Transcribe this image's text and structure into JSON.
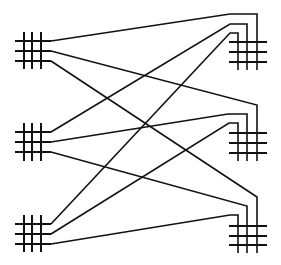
{
  "diagram": {
    "type": "bipartite-network",
    "width": 281,
    "height": 265,
    "stroke_color": "#111111",
    "background": "#ffffff",
    "left_nodes": [
      {
        "id": "L1",
        "rows": [
          41,
          51,
          61
        ],
        "cols": [
          24,
          32,
          41
        ],
        "x_min": 15,
        "x_max": 51,
        "y_min": 32,
        "y_max": 69
      },
      {
        "id": "L2",
        "rows": [
          132,
          142,
          152
        ],
        "cols": [
          24,
          32,
          41
        ],
        "x_min": 15,
        "x_max": 51,
        "y_min": 123,
        "y_max": 161
      },
      {
        "id": "L3",
        "rows": [
          224,
          234,
          244
        ],
        "cols": [
          24,
          32,
          41
        ],
        "x_min": 15,
        "x_max": 51,
        "y_min": 215,
        "y_max": 252
      }
    ],
    "right_nodes": [
      {
        "id": "R1",
        "rows": [
          42,
          52,
          62
        ],
        "cols": [
          238,
          247,
          257
        ],
        "x_min": 229,
        "x_max": 267,
        "y_max": 70
      },
      {
        "id": "R2",
        "rows": [
          133,
          143,
          153
        ],
        "cols": [
          238,
          247,
          257
        ],
        "x_min": 229,
        "x_max": 267,
        "y_max": 161
      },
      {
        "id": "R3",
        "rows": [
          226,
          236,
          245
        ],
        "cols": [
          238,
          247,
          257
        ],
        "x_min": 229,
        "x_max": 267,
        "y_max": 253
      }
    ],
    "links": [
      {
        "from": "L1",
        "row": 0,
        "to": "R1",
        "col": 2,
        "points": [
          [
            51,
            41
          ],
          [
            230,
            14
          ],
          [
            257,
            14
          ],
          [
            257,
            70
          ]
        ]
      },
      {
        "from": "L1",
        "row": 1,
        "to": "R2",
        "col": 2,
        "points": [
          [
            51,
            51
          ],
          [
            257,
            105
          ],
          [
            257,
            161
          ]
        ]
      },
      {
        "from": "L1",
        "row": 2,
        "to": "R3",
        "col": 2,
        "points": [
          [
            51,
            61
          ],
          [
            257,
            197
          ],
          [
            257,
            253
          ]
        ]
      },
      {
        "from": "L2",
        "row": 0,
        "to": "R1",
        "col": 1,
        "points": [
          [
            51,
            132
          ],
          [
            230,
            24
          ],
          [
            247,
            24
          ],
          [
            247,
            70
          ]
        ]
      },
      {
        "from": "L2",
        "row": 1,
        "to": "R2",
        "col": 1,
        "points": [
          [
            51,
            142
          ],
          [
            228,
            114
          ],
          [
            247,
            114
          ],
          [
            247,
            161
          ]
        ]
      },
      {
        "from": "L2",
        "row": 2,
        "to": "R3",
        "col": 1,
        "points": [
          [
            51,
            152
          ],
          [
            247,
            206
          ],
          [
            247,
            253
          ]
        ]
      },
      {
        "from": "L3",
        "row": 0,
        "to": "R1",
        "col": 0,
        "points": [
          [
            51,
            224
          ],
          [
            230,
            33
          ],
          [
            238,
            33
          ],
          [
            238,
            70
          ]
        ]
      },
      {
        "from": "L3",
        "row": 1,
        "to": "R2",
        "col": 0,
        "points": [
          [
            51,
            234
          ],
          [
            229,
            123
          ],
          [
            238,
            123
          ],
          [
            238,
            161
          ]
        ]
      },
      {
        "from": "L3",
        "row": 2,
        "to": "R3",
        "col": 0,
        "points": [
          [
            51,
            244
          ],
          [
            230,
            215
          ],
          [
            238,
            215
          ],
          [
            238,
            253
          ]
        ]
      }
    ]
  }
}
